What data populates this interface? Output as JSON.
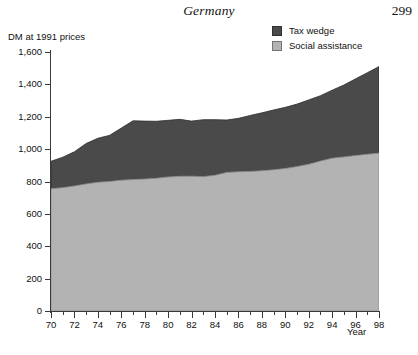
{
  "header": {
    "running_head": "Germany",
    "page_number": "299"
  },
  "axes": {
    "y_title": "DM at 1991 prices",
    "x_title": "Year"
  },
  "legend": {
    "items": [
      {
        "label": "Tax wedge",
        "color": "#4a4a4a",
        "icon": "legend-swatch-icon"
      },
      {
        "label": "Social assistance",
        "color": "#b3b3b3",
        "icon": "legend-swatch-icon"
      }
    ]
  },
  "chart_data": {
    "type": "area",
    "stacked": true,
    "title": "Germany",
    "xlabel": "Year",
    "ylabel": "DM at 1991 prices",
    "xlim": [
      70,
      98
    ],
    "ylim": [
      0,
      1600
    ],
    "ytick_labels": [
      "0",
      "200",
      "400",
      "600",
      "800",
      "1,000",
      "1,200",
      "1,400",
      "1,600"
    ],
    "ytick_values": [
      0,
      200,
      400,
      600,
      800,
      1000,
      1200,
      1400,
      1600
    ],
    "xtick_labels": [
      "70",
      "72",
      "74",
      "76",
      "78",
      "80",
      "82",
      "84",
      "86",
      "88",
      "90",
      "92",
      "94",
      "96",
      "98"
    ],
    "xtick_values": [
      70,
      72,
      74,
      76,
      78,
      80,
      82,
      84,
      86,
      88,
      90,
      92,
      94,
      96,
      98
    ],
    "minor_xticks": [
      71,
      73,
      75,
      77,
      79,
      81,
      83,
      85,
      87,
      89,
      91,
      93,
      95,
      97
    ],
    "grid": false,
    "legend_position": "top-right",
    "x": [
      70,
      71,
      72,
      73,
      74,
      75,
      76,
      77,
      78,
      79,
      80,
      81,
      82,
      83,
      84,
      85,
      86,
      87,
      88,
      89,
      90,
      91,
      92,
      93,
      94,
      95,
      96,
      97,
      98
    ],
    "series": [
      {
        "name": "Social assistance",
        "color": "#b3b3b3",
        "values": [
          755,
          762,
          772,
          785,
          795,
          800,
          808,
          812,
          815,
          820,
          828,
          832,
          833,
          830,
          838,
          856,
          860,
          862,
          866,
          872,
          880,
          892,
          906,
          926,
          944,
          952,
          960,
          968,
          975
        ]
      },
      {
        "name": "Tax wedge",
        "color": "#4a4a4a",
        "values": [
          170,
          188,
          212,
          250,
          272,
          285,
          322,
          363,
          358,
          352,
          350,
          352,
          340,
          352,
          344,
          324,
          330,
          346,
          358,
          370,
          378,
          386,
          398,
          404,
          420,
          444,
          474,
          504,
          535
        ]
      }
    ],
    "totals": [
      925,
      950,
      984,
      1035,
      1067,
      1085,
      1130,
      1175,
      1173,
      1172,
      1178,
      1184,
      1173,
      1182,
      1182,
      1180,
      1190,
      1208,
      1224,
      1242,
      1258,
      1278,
      1304,
      1330,
      1364,
      1396,
      1434,
      1472,
      1510
    ]
  }
}
